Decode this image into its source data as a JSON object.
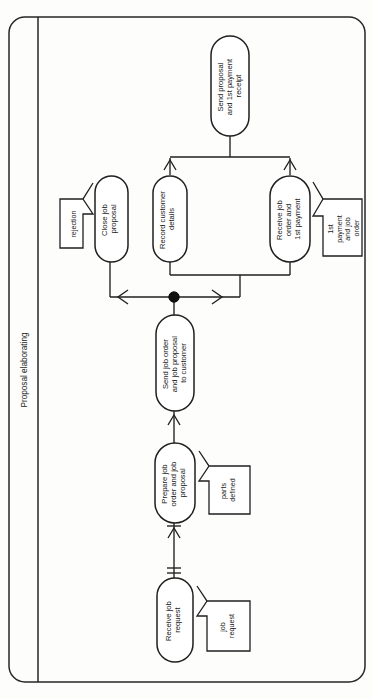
{
  "diagram": {
    "type": "activity-flow-diagram",
    "orientation": "rotated-90-counterclockwise",
    "pool": {
      "title": "Proposal elaborating"
    },
    "nodes": [
      {
        "id": "receive-job-request",
        "label": "Receive job request",
        "shape": "rounded-rectangle"
      },
      {
        "id": "prepare-job-order-and-job-proposal",
        "label": "Prepare job order and job proposal",
        "shape": "rounded-rectangle"
      },
      {
        "id": "send-job-order-and-job-proposal-to-customer",
        "label": "Send job order and job proposal to customer",
        "shape": "rounded-rectangle"
      },
      {
        "id": "close-job-proposal",
        "label": "Close job proposal",
        "shape": "rounded-rectangle"
      },
      {
        "id": "record-customer-details",
        "label": "Record customer details",
        "shape": "rounded-rectangle"
      },
      {
        "id": "receive-job-order-and-1st-payment",
        "label": "Receive job order and 1st payment",
        "shape": "rounded-rectangle"
      },
      {
        "id": "send-proposal-and-1st-payment-receipt",
        "label": "Send proposal and 1st payment receipt",
        "shape": "rounded-rectangle"
      }
    ],
    "artifacts": [
      {
        "id": "job-request",
        "label": "job request",
        "shape": "arrow-callout",
        "target": "receive-job-request"
      },
      {
        "id": "parts-defined",
        "label": "parts defined",
        "shape": "arrow-callout",
        "target": "prepare-job-order-and-job-proposal"
      },
      {
        "id": "rejection",
        "label": "rejection",
        "shape": "arrow-callout",
        "target": "close-job-proposal"
      },
      {
        "id": "1st-payment-and-job-order",
        "label": "1st payment and job order",
        "shape": "arrow-callout",
        "target": "receive-job-order-and-1st-payment"
      }
    ],
    "connectors": [
      {
        "from": "receive-job-request",
        "to": "prepare-job-order-and-job-proposal",
        "marker": "double-tick"
      },
      {
        "from": "prepare-job-order-and-job-proposal",
        "to": "send-job-order-and-job-proposal-to-customer",
        "marker": "double-tick"
      },
      {
        "from": "send-job-order-and-job-proposal-to-customer",
        "to": "decision-junction",
        "marker": "none"
      },
      {
        "from": "decision-junction",
        "to": "close-job-proposal",
        "marker": "arrow"
      },
      {
        "from": "decision-junction",
        "to": "record-customer-details",
        "marker": "arrow"
      },
      {
        "from": "decision-junction",
        "to": "receive-job-order-and-1st-payment",
        "marker": "arrow"
      },
      {
        "from": "record-customer-details",
        "to": "merge-join",
        "marker": "arrow"
      },
      {
        "from": "receive-job-order-and-1st-payment",
        "to": "merge-join",
        "marker": "arrow"
      },
      {
        "from": "merge-join",
        "to": "send-proposal-and-1st-payment-receipt",
        "marker": "none"
      }
    ],
    "colors": {
      "stroke": "#1f1f1f",
      "fill": "#ffffff",
      "background": "#fdfdfc",
      "junction": "#111111"
    }
  }
}
